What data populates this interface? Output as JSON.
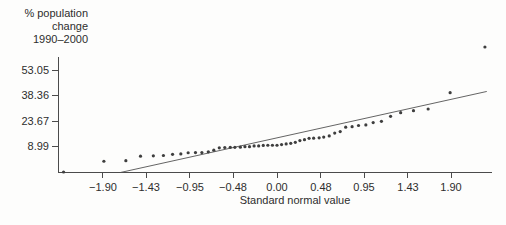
{
  "figure": {
    "background": "#fdfdfc",
    "ink_color": "#2d2d2d",
    "axis_color": "#4b4b4b",
    "point_color": "#3e3e3e",
    "trend_color": "#525252"
  },
  "chart_data": {
    "type": "scatter",
    "subtype": "normal-quantile-plot",
    "title": "",
    "xlabel": "Standard normal value",
    "ylabel_lines": [
      "% population",
      "change",
      "1990–2000"
    ],
    "x_ticks": [
      -1.9,
      -1.43,
      -0.95,
      -0.48,
      0.0,
      0.48,
      0.95,
      1.43,
      1.9
    ],
    "x_tick_labels": [
      "−1.90",
      "−1.43",
      "−0.95",
      "−0.48",
      "0.00",
      "0.48",
      "0.95",
      "1.43",
      "1.90"
    ],
    "y_ticks": [
      8.99,
      23.67,
      38.36,
      53.05
    ],
    "y_tick_labels": [
      "8.99",
      "23.67",
      "38.36",
      "53.05"
    ],
    "xlim": [
      -2.39,
      2.35
    ],
    "ylim": [
      -5.98,
      60.5
    ],
    "grid": false,
    "legend": null,
    "points": [
      [
        -2.33,
        -5.7
      ],
      [
        -1.89,
        0.5
      ],
      [
        -1.65,
        0.8
      ],
      [
        -1.49,
        3.4
      ],
      [
        -1.35,
        3.6
      ],
      [
        -1.24,
        3.8
      ],
      [
        -1.14,
        4.5
      ],
      [
        -1.05,
        4.7
      ],
      [
        -0.97,
        5.4
      ],
      [
        -0.89,
        5.5
      ],
      [
        -0.82,
        5.5
      ],
      [
        -0.75,
        5.9
      ],
      [
        -0.69,
        6.9
      ],
      [
        -0.63,
        8.2
      ],
      [
        -0.57,
        8.4
      ],
      [
        -0.51,
        8.5
      ],
      [
        -0.46,
        8.5
      ],
      [
        -0.4,
        8.6
      ],
      [
        -0.35,
        8.9
      ],
      [
        -0.3,
        8.9
      ],
      [
        -0.25,
        9.3
      ],
      [
        -0.2,
        9.3
      ],
      [
        -0.15,
        9.6
      ],
      [
        -0.1,
        9.7
      ],
      [
        -0.05,
        9.7
      ],
      [
        0.0,
        9.7
      ],
      [
        0.05,
        10.1
      ],
      [
        0.1,
        10.5
      ],
      [
        0.15,
        10.8
      ],
      [
        0.2,
        11.4
      ],
      [
        0.25,
        12.4
      ],
      [
        0.3,
        12.9
      ],
      [
        0.35,
        13.7
      ],
      [
        0.4,
        13.8
      ],
      [
        0.46,
        14.0
      ],
      [
        0.51,
        14.4
      ],
      [
        0.57,
        15.1
      ],
      [
        0.63,
        16.7
      ],
      [
        0.69,
        17.6
      ],
      [
        0.75,
        20.1
      ],
      [
        0.82,
        20.4
      ],
      [
        0.89,
        21.1
      ],
      [
        0.97,
        21.4
      ],
      [
        1.05,
        22.8
      ],
      [
        1.14,
        23.5
      ],
      [
        1.24,
        26.4
      ],
      [
        1.35,
        28.5
      ],
      [
        1.49,
        29.6
      ],
      [
        1.65,
        30.6
      ],
      [
        1.89,
        40.0
      ],
      [
        2.27,
        66.3
      ]
    ],
    "trend_line": {
      "slope": 11.7,
      "intercept": 13.9,
      "z_start": -1.71,
      "z_end": 2.29
    }
  }
}
